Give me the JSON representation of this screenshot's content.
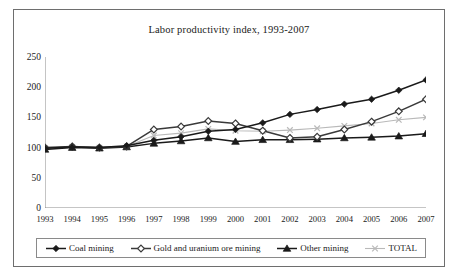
{
  "chart_data": {
    "type": "line",
    "title": "Labor productivity index, 1993-2007",
    "xlabel": "",
    "ylabel": "",
    "ylim": [
      0,
      250
    ],
    "yticks": [
      0,
      50,
      100,
      150,
      200,
      250
    ],
    "grid": false,
    "legend_position": "bottom",
    "categories": [
      "1993",
      "1994",
      "1995",
      "1996",
      "1997",
      "1998",
      "1999",
      "2000",
      "2001",
      "2002",
      "2003",
      "2004",
      "2005",
      "2006",
      "2007"
    ],
    "series": [
      {
        "name": "Coal mining",
        "marker": "filled-diamond",
        "color": "#1a1a1a",
        "values": [
          99,
          101,
          100,
          103,
          112,
          118,
          127,
          130,
          141,
          155,
          163,
          172,
          180,
          195,
          212
        ]
      },
      {
        "name": "Gold and uranium ore mining",
        "marker": "hollow-diamond",
        "color": "#3a3a3a",
        "values": [
          100,
          102,
          100,
          102,
          130,
          135,
          144,
          140,
          128,
          116,
          118,
          130,
          143,
          160,
          180
        ]
      },
      {
        "name": "Other mining",
        "marker": "filled-triangle",
        "color": "#1a1a1a",
        "values": [
          97,
          100,
          99,
          101,
          107,
          111,
          116,
          110,
          113,
          113,
          114,
          116,
          117,
          119,
          123
        ]
      },
      {
        "name": "TOTAL",
        "marker": "x",
        "color": "#b9b9b9",
        "values": [
          99,
          101,
          100,
          102,
          120,
          124,
          131,
          128,
          127,
          129,
          132,
          136,
          140,
          146,
          150
        ]
      }
    ]
  },
  "legend": {
    "items": [
      {
        "label": "Coal mining"
      },
      {
        "label": "Gold and uranium ore mining"
      },
      {
        "label": "Other mining"
      },
      {
        "label": "TOTAL"
      }
    ]
  }
}
